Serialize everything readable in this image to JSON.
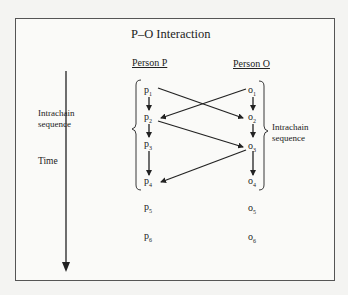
{
  "title": "P–O Interaction",
  "columns": {
    "person_p": "Person P",
    "person_o": "Person O"
  },
  "labels": {
    "intrachain_left": [
      "Intrachain",
      "sequence"
    ],
    "intrachain_right": [
      "Intrachain",
      "sequence"
    ],
    "time": "Time"
  },
  "nodes": {
    "p": [
      {
        "base": "p",
        "sub": "1"
      },
      {
        "base": "p",
        "sub": "2"
      },
      {
        "base": "p",
        "sub": "3"
      },
      {
        "base": "p",
        "sub": "4"
      },
      {
        "base": "p",
        "sub": "5"
      },
      {
        "base": "p",
        "sub": "6"
      }
    ],
    "o": [
      {
        "base": "o",
        "sub": "1"
      },
      {
        "base": "o",
        "sub": "2"
      },
      {
        "base": "o",
        "sub": "3"
      },
      {
        "base": "o",
        "sub": "4"
      },
      {
        "base": "o",
        "sub": "5"
      },
      {
        "base": "o",
        "sub": "6"
      }
    ]
  },
  "edges": [
    {
      "from": "p1",
      "to": "p2"
    },
    {
      "from": "p2",
      "to": "p3"
    },
    {
      "from": "p3",
      "to": "p4"
    },
    {
      "from": "o1",
      "to": "o2"
    },
    {
      "from": "o2",
      "to": "o3"
    },
    {
      "from": "o3",
      "to": "o4"
    },
    {
      "from": "p1",
      "to": "o2"
    },
    {
      "from": "o1",
      "to": "p2"
    },
    {
      "from": "p2",
      "to": "o3"
    },
    {
      "from": "o3",
      "to": "p4"
    }
  ],
  "colors": {
    "ink": "#222222",
    "frame": "#555555",
    "paper": "#fafaf8"
  }
}
